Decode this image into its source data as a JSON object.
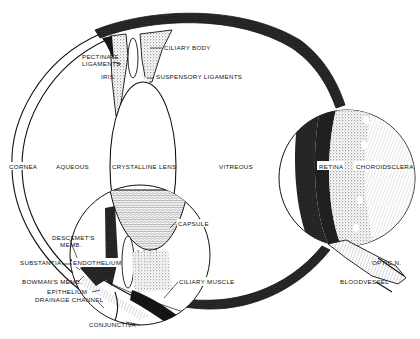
{
  "diagram": {
    "colors": {
      "ink": "#111111",
      "background": "#ffffff",
      "stipple": "#444444"
    },
    "labels": {
      "cornea": "CORNEA",
      "aqueous": "AQUEOUS",
      "crystalline_lens": "CRYSTALLINE LENS",
      "vitreous": "VITREOUS",
      "pectinate_ligaments_line1": "PECTINATE",
      "pectinate_ligaments_line2": "LIGAMENTS",
      "iris": "IRIS",
      "ciliary_body": "CILIARY BODY",
      "suspensory_ligaments": "SUSPENSORY LIGAMENTS",
      "retina": "RETINA",
      "choroid": "CHOROID",
      "sclera": "SCLERA",
      "capsule": "CAPSULE",
      "descemets_memb_line1": "DESCEMET'S",
      "descemets_memb_line2": "MEMB.",
      "substantia": "SUBSTANTIA",
      "endothelium": "ENDOTHELIUM",
      "bowmans_memb": "BOWMAN'S MEMB.",
      "epithelium": "EPITHELIUM",
      "drainage_channel": "DRAINAGE CHANNEL",
      "conjunctiva": "CONJUNCTIVA",
      "ciliary_muscle": "CILIARY MUSCLE",
      "optic_nerve": "OPTIC N.",
      "bloodvessel": "BLOODVESSEL"
    },
    "insets": [
      {
        "name": "anterior-chamber-magnified",
        "cx": 140,
        "cy": 255,
        "r": 70
      },
      {
        "name": "retina-layers-magnified",
        "cx": 347,
        "cy": 178,
        "r": 68
      }
    ]
  }
}
